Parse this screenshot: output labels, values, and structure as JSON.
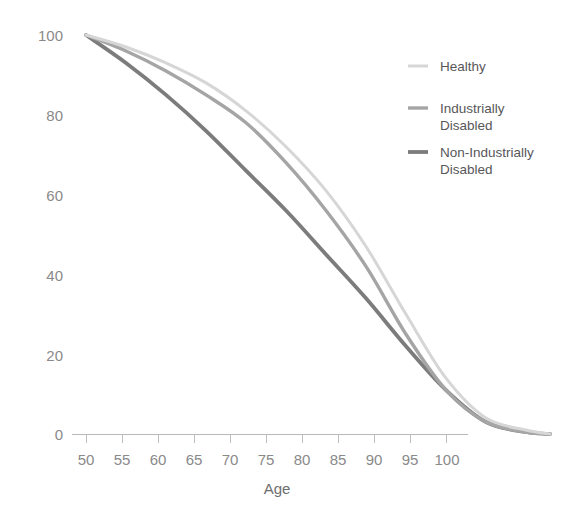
{
  "chart_data": {
    "type": "line",
    "title": "",
    "xlabel": "Age",
    "ylabel": "",
    "xlim": [
      50,
      108
    ],
    "ylim": [
      0,
      100
    ],
    "grid": false,
    "legend_position": "top-right",
    "xticks": [
      50,
      55,
      60,
      65,
      70,
      75,
      80,
      85,
      90,
      95,
      100
    ],
    "yticks": [
      0,
      20,
      40,
      60,
      80,
      100
    ],
    "x": [
      50,
      55,
      60,
      65,
      70,
      75,
      80,
      85,
      90,
      95,
      100,
      105,
      108
    ],
    "series": [
      {
        "name": "Healthy",
        "color": "#d6d6d6",
        "values": [
          100,
          97,
          93,
          88,
          81,
          72,
          61,
          47,
          30,
          14,
          4,
          1,
          0
        ]
      },
      {
        "name": "Industrially Disabled",
        "color": "#a5a5a5",
        "values": [
          100,
          96,
          91,
          85,
          78,
          68,
          56,
          42,
          25,
          11,
          3,
          0.5,
          0
        ]
      },
      {
        "name": "Non-Industrially Disabled",
        "color": "#7c7c7c",
        "values": [
          100,
          93,
          85,
          76,
          66,
          56,
          45,
          34,
          22,
          11,
          3,
          0.5,
          0
        ]
      }
    ]
  },
  "axis": {
    "x_title": "Age",
    "x_tick_labels": [
      "50",
      "55",
      "60",
      "65",
      "70",
      "75",
      "80",
      "85",
      "90",
      "95",
      "100"
    ],
    "y_tick_labels": [
      "100",
      "80",
      "60",
      "40",
      "20",
      "0"
    ]
  },
  "legend": {
    "entries": [
      {
        "label_line1": "Healthy",
        "label_line2": "",
        "color": "#d6d6d6"
      },
      {
        "label_line1": "Industrially",
        "label_line2": "Disabled",
        "color": "#a5a5a5"
      },
      {
        "label_line1": "Non-Industrially",
        "label_line2": "Disabled",
        "color": "#7c7c7c"
      }
    ]
  }
}
